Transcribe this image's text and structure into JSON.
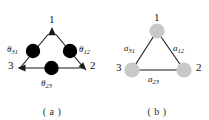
{
  "figure": {
    "panels": [
      {
        "id": "a",
        "caption": "( a )",
        "node_labels": [
          "1",
          "3",
          "2"
        ],
        "edge_labels": [
          {
            "symbol": "θ",
            "sub": "31"
          },
          {
            "symbol": "θ",
            "sub": "12"
          },
          {
            "symbol": "θ",
            "sub": "23"
          }
        ],
        "node_fill": "#000000",
        "edge_color": "#1a1a1a",
        "directed": true,
        "arrow_targets": [
          "1",
          "3",
          "2"
        ]
      },
      {
        "id": "b",
        "caption": "( b )",
        "node_labels": [
          "1",
          "3",
          "2"
        ],
        "edge_labels": [
          {
            "symbol": "a",
            "sub": "31"
          },
          {
            "symbol": "a",
            "sub": "12"
          },
          {
            "symbol": "a",
            "sub": "23"
          }
        ],
        "node_fill": "#c9c9c9",
        "edge_color": "#1a1a1a",
        "directed": false,
        "arrow_targets": []
      }
    ],
    "background": "#ffffff"
  }
}
